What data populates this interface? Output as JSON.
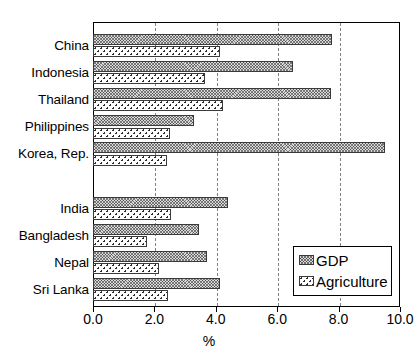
{
  "chart_data": {
    "type": "bar",
    "orientation": "horizontal",
    "title": "",
    "xlabel": "%",
    "ylabel": "",
    "xlim": [
      0.0,
      10.0
    ],
    "xticks": [
      "0.0",
      "2.0",
      "4.0",
      "6.0",
      "8.0",
      "10.0"
    ],
    "xtick_values": [
      0.0,
      2.0,
      4.0,
      6.0,
      8.0,
      10.0
    ],
    "grid": "vertical-dashed",
    "legend_position": "bottom-right",
    "categories": [
      "China",
      "Indonesia",
      "Thailand",
      "Philippines",
      "Korea, Rep.",
      "",
      "India",
      "Bangladesh",
      "Nepal",
      "Sri Lanka"
    ],
    "series": [
      {
        "name": "GDP",
        "pattern": "cross-hatch",
        "values": [
          7.8,
          6.5,
          7.75,
          3.3,
          9.5,
          null,
          4.4,
          3.45,
          3.7,
          4.15
        ]
      },
      {
        "name": "Agriculture",
        "pattern": "dotted",
        "values": [
          4.15,
          3.65,
          4.25,
          2.5,
          2.4,
          null,
          2.55,
          1.75,
          2.15,
          2.45
        ]
      }
    ]
  },
  "legend": {
    "items": [
      {
        "label": "GDP",
        "swatch": "cross-hatch"
      },
      {
        "label": "Agriculture",
        "swatch": "dotted"
      }
    ]
  },
  "axis": {
    "x_title": "%"
  },
  "colors": {
    "gdp_fill": "#d9d9d9",
    "agriculture_fill": "#ffffff",
    "outline": "#3a3a3a",
    "gridline": "#808080",
    "frame": "#000000",
    "background": "#ffffff"
  }
}
